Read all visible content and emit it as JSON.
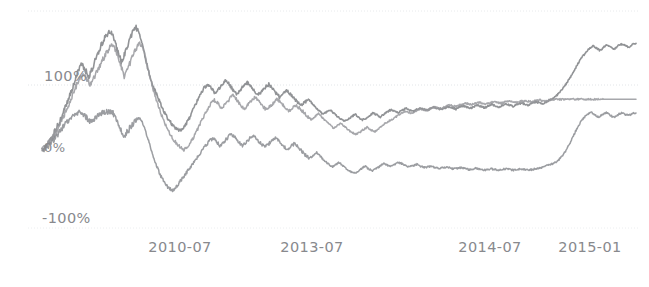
{
  "figure": {
    "width": 649,
    "height": 287,
    "background": "#ffffff",
    "plot_area": {
      "x0": 42,
      "x1": 636,
      "y_top": 11,
      "y_bottom": 228
    }
  },
  "axes": {
    "y_ticks": [
      {
        "label": "100%",
        "value": 100,
        "y": 85,
        "occluded": true
      },
      {
        "label": "0%",
        "value": 0,
        "y": 150,
        "occluded": true
      },
      {
        "label": "-100%",
        "value": -100,
        "y": 228,
        "occluded": false
      }
    ],
    "x_ticks": [
      {
        "label": "2010-07",
        "x": 180
      },
      {
        "label": "2013-07",
        "x": 312
      },
      {
        "label": "2014-07",
        "x": 490
      },
      {
        "label": "2015-01",
        "x": 590
      }
    ],
    "gridlines": [
      {
        "value": 200,
        "y": 11,
        "style": "dotted",
        "color": "#e8eaec"
      },
      {
        "value": 100,
        "y": 85,
        "style": "dotted",
        "color": "#e2e5e8"
      },
      {
        "value": -100,
        "y": 228,
        "style": "dotted",
        "color": "#eceef0"
      }
    ],
    "grid": true,
    "tick_color": "#8e9195"
  },
  "chart_data": {
    "type": "line",
    "title": "",
    "subtitle": "",
    "xlabel": "",
    "ylabel": "",
    "xlim": [
      "2009-01",
      "2015-06"
    ],
    "ylim": [
      -100,
      200
    ],
    "ytick_labels": [
      "100%",
      "0%",
      "-100%"
    ],
    "xtick_labels": [
      "2010-07",
      "2013-07",
      "2014-07",
      "2015-01"
    ],
    "grid": true,
    "legend": "none",
    "series": [
      {
        "name": "series-1",
        "color": "#7e8084",
        "linewidth": 1.6,
        "values": [
          0,
          6,
          14,
          22,
          33,
          45,
          58,
          72,
          88,
          104,
          120,
          131,
          124,
          112,
          126,
          141,
          155,
          168,
          177,
          183,
          171,
          152,
          136,
          148,
          163,
          178,
          190,
          181,
          160,
          134,
          112,
          96,
          84,
          70,
          58,
          48,
          40,
          34,
          30,
          33,
          40,
          50,
          62,
          74,
          86,
          95,
          101,
          96,
          88,
          93,
          100,
          107,
          101,
          93,
          86,
          92,
          99,
          104,
          98,
          91,
          85,
          90,
          96,
          101,
          95,
          88,
          82,
          86,
          91,
          86,
          80,
          74,
          69,
          73,
          78,
          72,
          66,
          60,
          55,
          58,
          62,
          57,
          52,
          48,
          44,
          47,
          51,
          55,
          50,
          46,
          49,
          53,
          57,
          54,
          51,
          55,
          59,
          62,
          60,
          57,
          61,
          64,
          62,
          59,
          62,
          65,
          63,
          61,
          64,
          66,
          64,
          62,
          65,
          67,
          65,
          63,
          66,
          68,
          66,
          64,
          67,
          69,
          67,
          65,
          68,
          70,
          68,
          66,
          69,
          71,
          69,
          67,
          70,
          72,
          71,
          69,
          72,
          74,
          73,
          71,
          74,
          77,
          80,
          84,
          90,
          97,
          105,
          114,
          124,
          134,
          143,
          150,
          156,
          160,
          157,
          153,
          158,
          162,
          159,
          155,
          160,
          163,
          161,
          158,
          162,
          164
        ]
      },
      {
        "name": "series-2",
        "color": "#96989c",
        "linewidth": 1.5,
        "values": [
          0,
          5,
          12,
          20,
          30,
          42,
          55,
          68,
          82,
          96,
          108,
          117,
          110,
          100,
          112,
          124,
          136,
          147,
          156,
          162,
          150,
          131,
          114,
          126,
          140,
          154,
          166,
          157,
          136,
          110,
          88,
          70,
          54,
          40,
          28,
          18,
          10,
          4,
          0,
          6,
          14,
          24,
          36,
          48,
          60,
          70,
          77,
          72,
          64,
          70,
          77,
          84,
          78,
          70,
          63,
          69,
          76,
          81,
          75,
          68,
          62,
          67,
          73,
          78,
          72,
          66,
          60,
          64,
          69,
          64,
          58,
          52,
          47,
          51,
          56,
          50,
          44,
          39,
          34,
          37,
          41,
          36,
          31,
          27,
          24,
          27,
          31,
          35,
          31,
          28,
          32,
          37,
          42,
          45,
          48,
          52,
          56,
          59,
          58,
          57,
          60,
          63,
          62,
          61,
          64,
          66,
          65,
          64,
          67,
          69,
          68,
          67,
          70,
          72,
          71,
          70,
          72,
          73,
          72,
          71,
          73,
          74,
          73,
          72,
          74,
          75,
          74,
          73,
          75,
          76,
          75,
          74,
          76,
          77,
          76,
          75,
          77,
          78,
          78,
          78,
          78,
          78,
          78,
          78,
          78,
          78,
          78,
          78,
          78,
          78,
          78,
          78,
          78,
          78,
          78,
          78,
          78,
          78,
          78,
          78
        ]
      },
      {
        "name": "series-3",
        "color": "#8a8c90",
        "linewidth": 1.5,
        "values": [
          0,
          3,
          8,
          14,
          22,
          30,
          38,
          44,
          50,
          55,
          58,
          56,
          50,
          44,
          48,
          52,
          56,
          58,
          60,
          58,
          48,
          34,
          20,
          28,
          36,
          44,
          50,
          44,
          28,
          8,
          -10,
          -26,
          -40,
          -50,
          -58,
          -62,
          -58,
          -50,
          -42,
          -34,
          -26,
          -18,
          -10,
          -2,
          6,
          13,
          18,
          13,
          6,
          12,
          19,
          25,
          19,
          12,
          6,
          12,
          18,
          22,
          16,
          10,
          4,
          9,
          15,
          19,
          13,
          7,
          1,
          5,
          10,
          4,
          -2,
          -8,
          -13,
          -9,
          -4,
          -10,
          -16,
          -21,
          -26,
          -23,
          -19,
          -24,
          -29,
          -33,
          -36,
          -33,
          -29,
          -25,
          -29,
          -32,
          -29,
          -25,
          -21,
          -23,
          -25,
          -22,
          -19,
          -21,
          -24,
          -26,
          -24,
          -22,
          -25,
          -27,
          -26,
          -25,
          -27,
          -28,
          -27,
          -26,
          -28,
          -29,
          -28,
          -27,
          -29,
          -30,
          -29,
          -28,
          -30,
          -31,
          -30,
          -29,
          -30,
          -31,
          -30,
          -29,
          -30,
          -31,
          -30,
          -29,
          -30,
          -31,
          -30,
          -29,
          -28,
          -26,
          -24,
          -22,
          -20,
          -16,
          -10,
          -2,
          8,
          20,
          32,
          42,
          50,
          55,
          58,
          54,
          50,
          55,
          58,
          54,
          50,
          54,
          57,
          55,
          53,
          56,
          57
        ]
      }
    ]
  }
}
